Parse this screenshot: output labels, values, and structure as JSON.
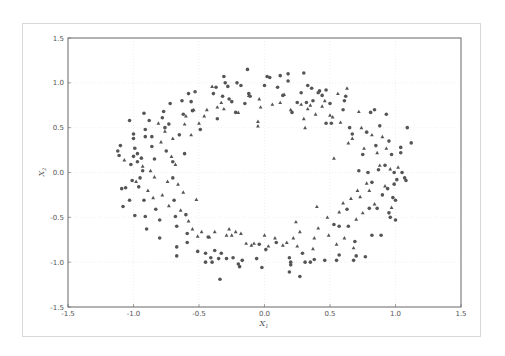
{
  "chart_data": {
    "type": "scatter",
    "title": "",
    "xlabel": "X",
    "xlabel_sub": "1",
    "ylabel": "X",
    "ylabel_sub": "2",
    "xlim": [
      -1.5,
      1.5
    ],
    "ylim": [
      -1.5,
      1.5
    ],
    "xticks": [
      "-1.5",
      "-1.0",
      "-0.5",
      "0.0",
      "0.5",
      "1.0",
      "1.5"
    ],
    "yticks": [
      "1.5",
      "1.0",
      "0.5",
      "0.0",
      "-0.5",
      "-1.0",
      "-1.5"
    ],
    "xtick_values": [
      -1.5,
      -1.0,
      -0.5,
      0.0,
      0.5,
      1.0,
      1.5
    ],
    "ytick_values": [
      1.5,
      1.0,
      0.5,
      0.0,
      -0.5,
      -1.0,
      -1.5
    ],
    "grid": true,
    "legend": "none",
    "marker_color": "#555555",
    "series": [
      {
        "name": "class 0",
        "marker": "circle",
        "points": [
          [
            -1.12,
            0.24
          ],
          [
            -1.1,
            0.3
          ],
          [
            -1.11,
            0.19
          ],
          [
            -1.06,
            -0.17
          ],
          [
            -1.09,
            -0.18
          ],
          [
            -1.08,
            -0.38
          ],
          [
            -1.03,
            -0.31
          ],
          [
            -1.03,
            0.58
          ],
          [
            -1.0,
            0.43
          ],
          [
            -1.0,
            0.38
          ],
          [
            -0.99,
            0.27
          ],
          [
            -1.0,
            0.18
          ],
          [
            -1.02,
            0.09
          ],
          [
            -1.01,
            -0.09
          ],
          [
            -0.99,
            -0.48
          ],
          [
            -0.97,
            0.21
          ],
          [
            -0.97,
            0.12
          ],
          [
            -0.96,
            -0.16
          ],
          [
            -0.95,
            -0.06
          ],
          [
            -0.94,
            0.16
          ],
          [
            -0.93,
            0.02
          ],
          [
            -0.92,
            -0.31
          ],
          [
            -0.91,
            -0.49
          ],
          [
            -0.9,
            -0.63
          ],
          [
            -0.91,
            0.48
          ],
          [
            -0.91,
            0.4
          ],
          [
            -0.92,
            0.66
          ],
          [
            -0.88,
            0.58
          ],
          [
            -0.86,
            0.4
          ],
          [
            -0.86,
            0.29
          ],
          [
            -0.84,
            0.15
          ],
          [
            -0.83,
            -0.41
          ],
          [
            -0.8,
            -0.53
          ],
          [
            -0.8,
            -0.73
          ],
          [
            -0.78,
            0.61
          ],
          [
            -0.77,
            0.68
          ],
          [
            -0.76,
            0.5
          ],
          [
            -0.75,
            0.24
          ],
          [
            -0.73,
            0.54
          ],
          [
            -0.72,
            0.77
          ],
          [
            -0.7,
            0.12
          ],
          [
            -0.7,
            -0.06
          ],
          [
            -0.69,
            -0.31
          ],
          [
            -0.68,
            -0.49
          ],
          [
            -0.67,
            -0.6
          ],
          [
            -0.67,
            -0.83
          ],
          [
            -0.67,
            -0.93
          ],
          [
            -0.65,
            0.42
          ],
          [
            -0.63,
            0.8
          ],
          [
            -0.62,
            0.65
          ],
          [
            -0.61,
            0.21
          ],
          [
            -0.6,
            -0.47
          ],
          [
            -0.59,
            -0.68
          ],
          [
            -0.59,
            -0.78
          ],
          [
            -0.58,
            0.88
          ],
          [
            -0.56,
            0.79
          ],
          [
            -0.55,
            0.69
          ],
          [
            -0.53,
            0.9
          ],
          [
            -0.51,
            -0.88
          ],
          [
            -0.49,
            0.48
          ],
          [
            -0.45,
            -0.9
          ],
          [
            -0.45,
            -1.0
          ],
          [
            -0.43,
            -0.72
          ],
          [
            -0.41,
            -0.95
          ],
          [
            -0.4,
            -1.0
          ],
          [
            -0.39,
            0.88
          ],
          [
            -0.38,
            -0.87
          ],
          [
            -0.37,
            0.95
          ],
          [
            -0.36,
            0.6
          ],
          [
            -0.35,
            -0.96
          ],
          [
            -0.34,
            -1.19
          ],
          [
            -0.33,
            -0.9
          ],
          [
            -0.32,
            0.85
          ],
          [
            -0.31,
            1.07
          ],
          [
            -0.3,
            1.0
          ],
          [
            -0.29,
            -0.96
          ],
          [
            -0.28,
            0.96
          ],
          [
            -0.27,
            0.82
          ],
          [
            -0.25,
            0.79
          ],
          [
            -0.24,
            -0.95
          ],
          [
            -0.22,
            0.67
          ],
          [
            -0.21,
            1.0
          ],
          [
            -0.2,
            -1.02
          ],
          [
            -0.19,
            -1.05
          ],
          [
            -0.18,
            0.97
          ],
          [
            -0.17,
            -0.98
          ],
          [
            -0.15,
            0.77
          ],
          [
            -0.13,
            1.15
          ],
          [
            -0.12,
            0.88
          ],
          [
            -0.11,
            0.85
          ],
          [
            -0.06,
            -0.96
          ],
          [
            -0.04,
            -0.8
          ],
          [
            -0.02,
            -1.06
          ],
          [
            0.0,
            0.97
          ],
          [
            0.01,
            -0.86
          ],
          [
            0.02,
            1.07
          ],
          [
            0.04,
            1.06
          ],
          [
            0.09,
            -0.78
          ],
          [
            0.1,
            0.95
          ],
          [
            0.12,
            1.08
          ],
          [
            0.14,
            0.86
          ],
          [
            0.18,
            1.1
          ],
          [
            0.18,
            1.02
          ],
          [
            0.19,
            -0.95
          ],
          [
            0.2,
            -1.0
          ],
          [
            0.2,
            -1.03
          ],
          [
            0.19,
            -1.11
          ],
          [
            0.21,
            0.67
          ],
          [
            0.25,
            0.78
          ],
          [
            0.27,
            -1.16
          ],
          [
            0.28,
            0.89
          ],
          [
            0.29,
            -0.9
          ],
          [
            0.3,
            1.11
          ],
          [
            0.31,
            -1.0
          ],
          [
            0.32,
            0.78
          ],
          [
            0.33,
            0.97
          ],
          [
            0.35,
            -1.0
          ],
          [
            0.36,
            0.94
          ],
          [
            0.37,
            0.8
          ],
          [
            0.38,
            -0.97
          ],
          [
            0.41,
            0.89
          ],
          [
            0.42,
            0.91
          ],
          [
            0.44,
            0.86
          ],
          [
            0.47,
            0.92
          ],
          [
            0.46,
            -0.98
          ],
          [
            0.47,
            0.55
          ],
          [
            0.5,
            0.77
          ],
          [
            0.51,
            0.55
          ],
          [
            0.53,
            -0.58
          ],
          [
            0.55,
            -0.98
          ],
          [
            0.57,
            -0.6
          ],
          [
            0.57,
            -0.92
          ],
          [
            0.6,
            0.7
          ],
          [
            0.61,
            0.8
          ],
          [
            0.62,
            0.85
          ],
          [
            0.63,
            -0.41
          ],
          [
            0.64,
            -0.6
          ],
          [
            0.65,
            0.5
          ],
          [
            0.67,
            0.43
          ],
          [
            0.68,
            -0.98
          ],
          [
            0.7,
            -0.93
          ],
          [
            0.69,
            -0.77
          ],
          [
            0.72,
            0.02
          ],
          [
            0.75,
            0.2
          ],
          [
            0.77,
            -0.94
          ],
          [
            0.78,
            0.45
          ],
          [
            0.79,
            0.0
          ],
          [
            0.8,
            -0.4
          ],
          [
            0.81,
            0.67
          ],
          [
            0.82,
            -0.11
          ],
          [
            0.82,
            -0.7
          ],
          [
            0.84,
            0.7
          ],
          [
            0.85,
            0.3
          ],
          [
            0.86,
            -0.4
          ],
          [
            0.87,
            0.03
          ],
          [
            0.88,
            0.52
          ],
          [
            0.89,
            -0.7
          ],
          [
            0.9,
            -0.25
          ],
          [
            0.92,
            0.08
          ],
          [
            0.93,
            0.65
          ],
          [
            0.94,
            -0.18
          ],
          [
            0.95,
            0.35
          ],
          [
            0.95,
            -0.45
          ],
          [
            0.96,
            -0.5
          ],
          [
            0.97,
            0.2
          ],
          [
            0.98,
            -0.28
          ],
          [
            0.99,
            0.0
          ],
          [
            0.99,
            -0.13
          ],
          [
            1.0,
            -0.31
          ],
          [
            1.0,
            -0.53
          ],
          [
            1.01,
            -0.08
          ],
          [
            1.04,
            0.28
          ],
          [
            1.04,
            0.22
          ],
          [
            1.05,
            0.0
          ],
          [
            1.07,
            -0.06
          ],
          [
            1.08,
            -0.09
          ],
          [
            1.09,
            0.5
          ],
          [
            1.12,
            0.33
          ]
        ]
      },
      {
        "name": "class 1",
        "marker": "triangle",
        "points": [
          [
            -1.07,
            0.14
          ],
          [
            -0.98,
            -0.1
          ],
          [
            -0.93,
            0.07
          ],
          [
            -0.89,
            -0.2
          ],
          [
            -0.87,
            0.02
          ],
          [
            -0.85,
            -0.28
          ],
          [
            -0.84,
            -0.05
          ],
          [
            -0.81,
            0.55
          ],
          [
            -0.79,
            0.34
          ],
          [
            -0.78,
            -0.25
          ],
          [
            -0.76,
            0.46
          ],
          [
            -0.74,
            -0.1
          ],
          [
            -0.73,
            -0.37
          ],
          [
            -0.71,
            0.18
          ],
          [
            -0.7,
            0.38
          ],
          [
            -0.68,
            0.09
          ],
          [
            -0.66,
            -0.13
          ],
          [
            -0.64,
            -0.42
          ],
          [
            -0.62,
            -0.22
          ],
          [
            -0.61,
            0.54
          ],
          [
            -0.6,
            0.63
          ],
          [
            -0.58,
            -0.54
          ],
          [
            -0.56,
            0.42
          ],
          [
            -0.55,
            -0.63
          ],
          [
            -0.54,
            0.7
          ],
          [
            -0.52,
            -0.3
          ],
          [
            -0.51,
            -0.71
          ],
          [
            -0.5,
            0.55
          ],
          [
            -0.48,
            -0.66
          ],
          [
            -0.46,
            0.63
          ],
          [
            -0.44,
            0.7
          ],
          [
            -0.42,
            -0.72
          ],
          [
            -0.4,
            0.96
          ],
          [
            -0.38,
            -0.66
          ],
          [
            -0.36,
            0.73
          ],
          [
            -0.33,
            0.78
          ],
          [
            -0.31,
            0.71
          ],
          [
            -0.29,
            -0.7
          ],
          [
            -0.27,
            -0.63
          ],
          [
            -0.25,
            -0.7
          ],
          [
            -0.22,
            -0.66
          ],
          [
            -0.2,
            0.67
          ],
          [
            -0.18,
            -0.68
          ],
          [
            -0.14,
            -0.79
          ],
          [
            -0.12,
            0.86
          ],
          [
            -0.1,
            -0.81
          ],
          [
            -0.08,
            -0.79
          ],
          [
            -0.05,
            0.52
          ],
          [
            -0.05,
            0.57
          ],
          [
            -0.04,
            0.82
          ],
          [
            -0.03,
            0.73
          ],
          [
            0.0,
            -0.7
          ],
          [
            0.03,
            -0.82
          ],
          [
            0.06,
            0.76
          ],
          [
            0.08,
            -0.73
          ],
          [
            0.12,
            0.78
          ],
          [
            0.14,
            -0.81
          ],
          [
            0.15,
            0.87
          ],
          [
            0.17,
            -0.78
          ],
          [
            0.2,
            0.7
          ],
          [
            0.22,
            -0.73
          ],
          [
            0.24,
            -0.55
          ],
          [
            0.25,
            -0.82
          ],
          [
            0.27,
            -0.66
          ],
          [
            0.28,
            0.76
          ],
          [
            0.3,
            0.6
          ],
          [
            0.31,
            0.5
          ],
          [
            0.33,
            0.71
          ],
          [
            0.35,
            0.75
          ],
          [
            0.37,
            -0.85
          ],
          [
            0.38,
            -0.73
          ],
          [
            0.39,
            0.65
          ],
          [
            0.4,
            -0.38
          ],
          [
            0.41,
            -0.62
          ],
          [
            0.44,
            0.74
          ],
          [
            0.46,
            0.8
          ],
          [
            0.48,
            -0.5
          ],
          [
            0.49,
            -0.7
          ],
          [
            0.5,
            0.64
          ],
          [
            0.52,
            0.62
          ],
          [
            0.53,
            0.16
          ],
          [
            0.55,
            -0.8
          ],
          [
            0.56,
            0.88
          ],
          [
            0.57,
            -0.44
          ],
          [
            0.58,
            0.56
          ],
          [
            0.6,
            -0.34
          ],
          [
            0.61,
            -0.73
          ],
          [
            0.63,
            0.94
          ],
          [
            0.64,
            0.33
          ],
          [
            0.66,
            -0.29
          ],
          [
            0.67,
            0.38
          ],
          [
            0.68,
            -0.84
          ],
          [
            0.7,
            -0.52
          ],
          [
            0.71,
            -0.2
          ],
          [
            0.72,
            0.68
          ],
          [
            0.73,
            -0.27
          ],
          [
            0.74,
            0.5
          ],
          [
            0.75,
            -0.45
          ],
          [
            0.76,
            0.27
          ],
          [
            0.78,
            -0.12
          ],
          [
            0.8,
            -0.2
          ],
          [
            0.82,
            0.42
          ],
          [
            0.84,
            -0.35
          ],
          [
            0.86,
            0.22
          ],
          [
            0.88,
            0.08
          ],
          [
            0.9,
            0.4
          ],
          [
            0.92,
            -0.15
          ],
          [
            0.93,
            0.27
          ],
          [
            0.96,
            0.04
          ],
          [
            0.97,
            -0.39
          ],
          [
            1.02,
            0.06
          ]
        ]
      }
    ]
  }
}
